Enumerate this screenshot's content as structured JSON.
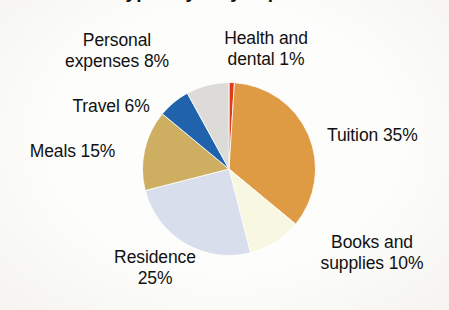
{
  "chart_data": {
    "type": "pie",
    "title": "Typical yearly expenses",
    "xlabel": "",
    "ylabel": "",
    "unit": "%",
    "start_angle_deg": 0,
    "direction": "clockwise",
    "legend": "none",
    "grid": false,
    "categories": [
      "Health and dental",
      "Tuition",
      "Books and supplies",
      "Residence",
      "Meals",
      "Travel",
      "Personal expenses"
    ],
    "values": [
      1,
      35,
      10,
      25,
      15,
      6,
      8
    ],
    "colors": [
      "#E23A18",
      "#E09A42",
      "#F7F7E2",
      "#D9DEEC",
      "#CFAE5E",
      "#1F63AE",
      "#DCDBD8"
    ],
    "slices": [
      {
        "label": "Health and dental",
        "value": 1,
        "display": "Health and dental 1%",
        "color": "#E23A18"
      },
      {
        "label": "Tuition",
        "value": 35,
        "display": "Tuition 35%",
        "color": "#E09A42"
      },
      {
        "label": "Books and supplies",
        "value": 10,
        "display": "Books and supplies 10%",
        "color": "#F7F7E2"
      },
      {
        "label": "Residence",
        "value": 25,
        "display": "Residence 25%",
        "color": "#D9DEEC"
      },
      {
        "label": "Meals",
        "value": 15,
        "display": "Meals 15%",
        "color": "#CFAE5E"
      },
      {
        "label": "Travel",
        "value": 6,
        "display": "Travel 6%",
        "color": "#1F63AE"
      },
      {
        "label": "Personal expenses",
        "value": 8,
        "display": "Personal expenses 8%",
        "color": "#DCDBD8"
      }
    ]
  },
  "labels": {
    "personal": "Personal\nexpenses 8%",
    "health": "Health and\ndental 1%",
    "travel": "Travel 6%",
    "meals": "Meals 15%",
    "tuition": "Tuition 35%",
    "books": "Books and\nsupplies 10%",
    "residence": "Residence\n25%"
  },
  "style": {
    "background": "#fdfdfb",
    "text_color": "#111111"
  }
}
